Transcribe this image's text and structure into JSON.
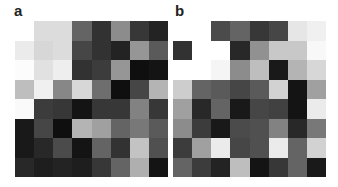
{
  "figure": {
    "panels": [
      {
        "label": "a",
        "rows": 8,
        "cols": 8,
        "gray_values": [
          [
            255,
            220,
            220,
            100,
            50,
            140,
            55,
            35
          ],
          [
            235,
            215,
            220,
            70,
            50,
            35,
            150,
            90
          ],
          [
            252,
            225,
            238,
            50,
            60,
            150,
            15,
            20
          ],
          [
            190,
            240,
            135,
            215,
            110,
            15,
            70,
            180
          ],
          [
            250,
            60,
            55,
            20,
            55,
            55,
            130,
            55
          ],
          [
            25,
            70,
            15,
            180,
            160,
            100,
            120,
            90
          ],
          [
            25,
            40,
            75,
            20,
            100,
            50,
            195,
            80
          ],
          [
            40,
            30,
            35,
            30,
            55,
            100,
            175,
            20
          ]
        ]
      },
      {
        "label": "b",
        "rows": 8,
        "cols": 8,
        "gray_values": [
          [
            255,
            255,
            75,
            100,
            55,
            70,
            230,
            240
          ],
          [
            50,
            255,
            255,
            40,
            145,
            200,
            200,
            248
          ],
          [
            255,
            255,
            245,
            140,
            190,
            25,
            180,
            215
          ],
          [
            205,
            100,
            90,
            70,
            90,
            210,
            20,
            160
          ],
          [
            160,
            40,
            100,
            25,
            70,
            65,
            20,
            235
          ],
          [
            140,
            60,
            25,
            75,
            80,
            130,
            40,
            120
          ],
          [
            60,
            160,
            235,
            70,
            80,
            235,
            100,
            210
          ],
          [
            100,
            60,
            35,
            190,
            20,
            55,
            100,
            25
          ]
        ]
      }
    ]
  }
}
